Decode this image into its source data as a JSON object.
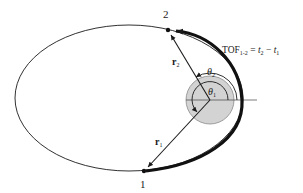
{
  "diagram": {
    "points": [
      {
        "id": "1",
        "label": "1"
      },
      {
        "id": "2",
        "label": "2"
      }
    ],
    "vectors": [
      {
        "id": "r1",
        "label": "r",
        "subscript": "1"
      },
      {
        "id": "r2",
        "label": "r",
        "subscript": "2"
      }
    ],
    "angles": [
      {
        "id": "theta1",
        "label": "θ",
        "subscript": "1"
      },
      {
        "id": "theta2",
        "label": "θ",
        "subscript": "2"
      }
    ],
    "equation": {
      "lhs": "TOF",
      "lhs_sub": "1-2",
      "eq": " = ",
      "t2": "t",
      "t2_sub": "2",
      "minus": " − ",
      "t1": "t",
      "t1_sub": "1"
    },
    "colors": {
      "line": "#1a1a1a",
      "planet_fill": "#d0d0d0",
      "planet_stroke": "#8a8a8a"
    }
  }
}
